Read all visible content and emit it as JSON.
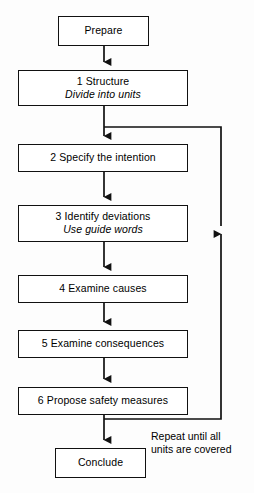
{
  "diagram": {
    "type": "flowchart",
    "title_text": "",
    "orientation": "vertical",
    "line_color": "#111111",
    "box_fill": "#ffffff",
    "background": "#fdfdfd",
    "nodes": [
      {
        "id": "prepare",
        "line1": "Prepare",
        "line2": "",
        "x": 58,
        "y": 16,
        "w": 91,
        "h": 30
      },
      {
        "id": "step1",
        "line1": "1  Structure",
        "line2": "Divide into units",
        "x": 18,
        "y": 70,
        "w": 170,
        "h": 36
      },
      {
        "id": "step2",
        "line1": "2  Specify the intention",
        "line2": "",
        "x": 18,
        "y": 144,
        "w": 170,
        "h": 28
      },
      {
        "id": "step3",
        "line1": "3  Identify deviations",
        "line2": "Use guide words",
        "x": 18,
        "y": 205,
        "w": 170,
        "h": 37
      },
      {
        "id": "step4",
        "line1": "4  Examine causes",
        "line2": "",
        "x": 18,
        "y": 275,
        "w": 170,
        "h": 28
      },
      {
        "id": "step5",
        "line1": "5  Examine consequences",
        "line2": "",
        "x": 18,
        "y": 330,
        "w": 170,
        "h": 28
      },
      {
        "id": "step6",
        "line1": "6  Propose safety measures",
        "line2": "",
        "x": 18,
        "y": 387,
        "w": 170,
        "h": 28
      },
      {
        "id": "conclude",
        "line1": "Conclude",
        "line2": "",
        "x": 55,
        "y": 448,
        "w": 91,
        "h": 30
      }
    ],
    "connectors": [
      {
        "id": "prepare-to-1",
        "from": "prepare",
        "to": "step1",
        "kind": "arrow-down"
      },
      {
        "id": "1-to-2",
        "from": "step1",
        "to": "step2",
        "kind": "arrow-down"
      },
      {
        "id": "2-to-3",
        "from": "step2",
        "to": "step3",
        "kind": "arrow-down"
      },
      {
        "id": "3-to-4",
        "from": "step3",
        "to": "step4",
        "kind": "arrow-down"
      },
      {
        "id": "4-to-5",
        "from": "step4",
        "to": "step5",
        "kind": "arrow-down"
      },
      {
        "id": "5-to-6",
        "from": "step5",
        "to": "step6",
        "kind": "arrow-down"
      },
      {
        "id": "6-to-conclude",
        "from": "step6",
        "to": "conclude",
        "kind": "arrow-down"
      },
      {
        "id": "feedback-loop",
        "from": "step6",
        "to": "step2",
        "kind": "loop-up-right"
      }
    ],
    "loop_label": {
      "line1": "Repeat until all",
      "line2": "units are covered",
      "x": 151,
      "y": 430
    }
  }
}
